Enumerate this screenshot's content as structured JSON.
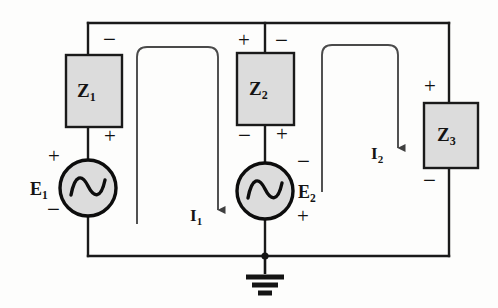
{
  "figure": {
    "background_color": "#fdfdfc",
    "wire_color": "#1a1a1a",
    "component_fill": "#dcdcdc",
    "mesh_arrow_color": "#4a4a4a"
  },
  "components": {
    "z1": {
      "label": "Z",
      "subscript": "1",
      "name": "impedance-z1"
    },
    "z2": {
      "label": "Z",
      "subscript": "2",
      "name": "impedance-z2"
    },
    "z3": {
      "label": "Z",
      "subscript": "3",
      "name": "impedance-z3"
    },
    "e1": {
      "label": "E",
      "subscript": "1",
      "name": "voltage-source-e1"
    },
    "e2": {
      "label": "E",
      "subscript": "2",
      "name": "voltage-source-e2"
    }
  },
  "mesh_currents": {
    "i1": {
      "label": "I",
      "subscript": "1"
    },
    "i2": {
      "label": "I",
      "subscript": "2"
    }
  },
  "polarity": {
    "plus": "+",
    "minus": "−",
    "z1_top": "−",
    "z1_bottom": "+",
    "z2_top_left": "+",
    "z2_top_right": "−",
    "z2_bottom_left": "−",
    "z2_bottom_right": "+",
    "z3_top": "+",
    "z3_bottom": "−",
    "e1_top": "+",
    "e1_bottom": "−",
    "e2_top": "−",
    "e2_bottom": "+"
  },
  "ground": {
    "name": "earth-ground-symbol"
  }
}
